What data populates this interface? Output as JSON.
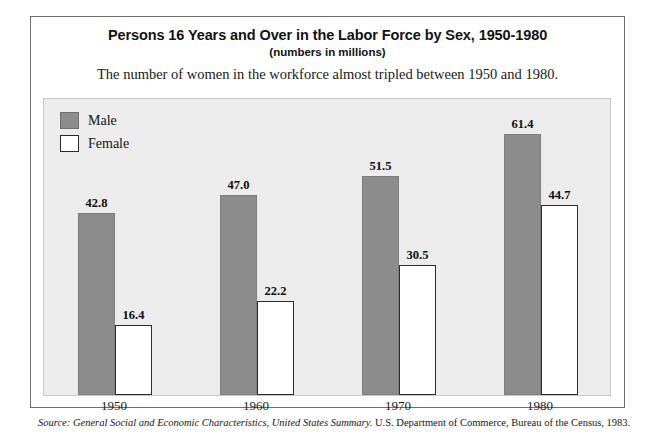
{
  "header": {
    "title": "Persons 16 Years and Over in the Labor Force by Sex, 1950-1980",
    "units_note": "(numbers in millions)",
    "lead_text": "The number of women in the workforce almost tripled between 1950 and 1980."
  },
  "legend": {
    "position": "top-left-inside-plot",
    "items": [
      {
        "label": "Male",
        "color": "#8c8c8c",
        "swatch": "filled-gray"
      },
      {
        "label": "Female",
        "color": "#ffffff",
        "swatch": "outlined-white"
      }
    ]
  },
  "source": {
    "prefix": "Source:",
    "publication": "General Social and Economic Characteristics, United States Summary.",
    "agency": "U.S. Department of Commerce, Bureau of the Census, 1983."
  },
  "colors": {
    "male_bar": "#8c8c8c",
    "female_bar": "#ffffff",
    "female_bar_border": "#2b2b2b",
    "plot_background": "#ececec",
    "frame_border": "#6e6e6e",
    "text": "#121212"
  },
  "chart_data": {
    "type": "bar",
    "title": "Persons 16 Years and Over in the Labor Force by Sex, 1950-1980",
    "subtitle": "(numbers in millions)",
    "xlabel": "",
    "ylabel": "",
    "ylim": [
      0,
      70
    ],
    "grid": false,
    "legend_position": "top-left",
    "axis_visible": false,
    "categories": [
      "1950",
      "1960",
      "1970",
      "1980"
    ],
    "series": [
      {
        "name": "Male",
        "color": "#8c8c8c",
        "values": [
          42.8,
          47.0,
          51.5,
          61.4
        ],
        "labels": [
          "42.8",
          "47.0",
          "51.5",
          "61.4"
        ]
      },
      {
        "name": "Female",
        "color": "#ffffff",
        "values": [
          16.4,
          22.2,
          30.5,
          44.7
        ],
        "labels": [
          "16.4",
          "22.2",
          "30.5",
          "44.7"
        ]
      }
    ],
    "annotations": [
      "The number of women in the workforce almost tripled between 1950 and 1980."
    ]
  }
}
